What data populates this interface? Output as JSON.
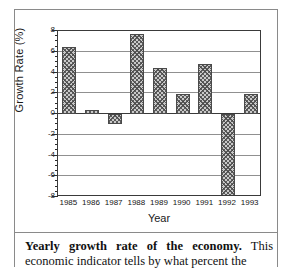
{
  "chart_data": {
    "type": "bar",
    "title": "",
    "xlabel": "Year",
    "ylabel": "Growth Rate (%)",
    "categories": [
      "1985",
      "1986",
      "1987",
      "1988",
      "1989",
      "1990",
      "1991",
      "1992",
      "1993"
    ],
    "values": [
      6.5,
      0.4,
      -1.0,
      7.7,
      4.4,
      1.9,
      4.8,
      -8.0,
      1.9
    ],
    "ylim": [
      -8,
      8
    ],
    "yticks": [
      8,
      6,
      4,
      2,
      0,
      -2,
      -4,
      -6,
      -8
    ],
    "ytick_labels": [
      "8",
      "6",
      "4",
      "2",
      "0",
      "-2",
      "-4",
      "-6",
      "-8"
    ],
    "grid": true,
    "legend": null,
    "bar_fill": "#c9c9c9",
    "bar_hatch": "crosshatch",
    "bar_edge_color": "#4a4a4a",
    "axis_color": "#3a3a3a",
    "grid_color": "#909090"
  },
  "caption": {
    "heading": "Yearly growth rate of the economy.",
    "body": " This economic indicator tells by what percent the"
  }
}
